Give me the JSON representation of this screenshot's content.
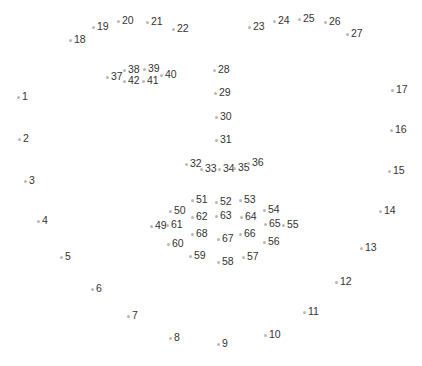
{
  "diagram": {
    "title": "",
    "type": "facial-landmarks",
    "dot_color": "#b8b8b8",
    "label_color": "#333333",
    "background": "#ffffff",
    "points": [
      {
        "id": "1",
        "x": 18,
        "y": 97
      },
      {
        "id": "2",
        "x": 19,
        "y": 139
      },
      {
        "id": "3",
        "x": 25,
        "y": 181
      },
      {
        "id": "4",
        "x": 38,
        "y": 221
      },
      {
        "id": "5",
        "x": 61,
        "y": 257
      },
      {
        "id": "6",
        "x": 92,
        "y": 289
      },
      {
        "id": "7",
        "x": 128,
        "y": 316
      },
      {
        "id": "8",
        "x": 170,
        "y": 338
      },
      {
        "id": "9",
        "x": 218,
        "y": 344
      },
      {
        "id": "10",
        "x": 265,
        "y": 335
      },
      {
        "id": "11",
        "x": 304,
        "y": 312
      },
      {
        "id": "12",
        "x": 336,
        "y": 282
      },
      {
        "id": "13",
        "x": 361,
        "y": 248
      },
      {
        "id": "14",
        "x": 380,
        "y": 211
      },
      {
        "id": "15",
        "x": 389,
        "y": 171
      },
      {
        "id": "16",
        "x": 391,
        "y": 130
      },
      {
        "id": "17",
        "x": 392,
        "y": 90
      },
      {
        "id": "18",
        "x": 70,
        "y": 40
      },
      {
        "id": "19",
        "x": 93,
        "y": 27
      },
      {
        "id": "20",
        "x": 118,
        "y": 21
      },
      {
        "id": "21",
        "x": 147,
        "y": 22
      },
      {
        "id": "22",
        "x": 173,
        "y": 29
      },
      {
        "id": "23",
        "x": 249,
        "y": 27
      },
      {
        "id": "24",
        "x": 274,
        "y": 21
      },
      {
        "id": "25",
        "x": 299,
        "y": 19
      },
      {
        "id": "26",
        "x": 325,
        "y": 22
      },
      {
        "id": "27",
        "x": 347,
        "y": 34
      },
      {
        "id": "28",
        "x": 214,
        "y": 70
      },
      {
        "id": "29",
        "x": 215,
        "y": 93
      },
      {
        "id": "30",
        "x": 216,
        "y": 117
      },
      {
        "id": "31",
        "x": 216,
        "y": 140
      },
      {
        "id": "32",
        "x": 186,
        "y": 164
      },
      {
        "id": "33",
        "x": 201,
        "y": 169
      },
      {
        "id": "34",
        "x": 219,
        "y": 169
      },
      {
        "id": "35",
        "x": 234,
        "y": 168
      },
      {
        "id": "36",
        "x": 248,
        "y": 163
      },
      {
        "id": "37",
        "x": 107,
        "y": 77
      },
      {
        "id": "38",
        "x": 124,
        "y": 70
      },
      {
        "id": "39",
        "x": 144,
        "y": 69
      },
      {
        "id": "40",
        "x": 161,
        "y": 75
      },
      {
        "id": "41",
        "x": 143,
        "y": 81
      },
      {
        "id": "42",
        "x": 124,
        "y": 81
      },
      {
        "id": "49",
        "x": 151,
        "y": 226
      },
      {
        "id": "50",
        "x": 170,
        "y": 211
      },
      {
        "id": "51",
        "x": 192,
        "y": 200
      },
      {
        "id": "52",
        "x": 216,
        "y": 202
      },
      {
        "id": "53",
        "x": 240,
        "y": 200
      },
      {
        "id": "54",
        "x": 264,
        "y": 210
      },
      {
        "id": "55",
        "x": 283,
        "y": 225
      },
      {
        "id": "56",
        "x": 264,
        "y": 242
      },
      {
        "id": "57",
        "x": 243,
        "y": 257
      },
      {
        "id": "58",
        "x": 218,
        "y": 262
      },
      {
        "id": "59",
        "x": 190,
        "y": 256
      },
      {
        "id": "60",
        "x": 168,
        "y": 244
      },
      {
        "id": "61",
        "x": 167,
        "y": 225
      },
      {
        "id": "62",
        "x": 192,
        "y": 217
      },
      {
        "id": "63",
        "x": 216,
        "y": 216
      },
      {
        "id": "64",
        "x": 241,
        "y": 217
      },
      {
        "id": "65",
        "x": 265,
        "y": 224
      },
      {
        "id": "66",
        "x": 240,
        "y": 234
      },
      {
        "id": "67",
        "x": 218,
        "y": 239
      },
      {
        "id": "68",
        "x": 192,
        "y": 234
      }
    ]
  }
}
